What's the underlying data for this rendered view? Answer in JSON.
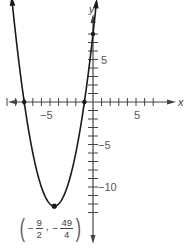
{
  "chart_data": {
    "type": "line",
    "title": "",
    "function": "f(x) = x^2 + 9x + 8",
    "xlabel": "x",
    "ylabel": "y",
    "xlim": [
      -10,
      7.5
    ],
    "ylim": [
      -14,
      9.5
    ],
    "x_ticks": [
      -10,
      -9,
      -8,
      -7,
      -6,
      -5,
      -4,
      -3,
      -2,
      -1,
      1,
      2,
      3,
      4,
      5,
      6,
      7
    ],
    "y_ticks": [
      -13,
      -12,
      -11,
      -10,
      -9,
      -8,
      -7,
      -6,
      -5,
      -4,
      -3,
      -2,
      -1,
      1,
      2,
      3,
      4,
      5,
      6,
      7,
      8
    ],
    "x_tick_labels": [
      "-5",
      "5"
    ],
    "y_tick_labels": [
      "5",
      "-5",
      "-10"
    ],
    "grid": false,
    "legend": null,
    "series": [
      {
        "name": "parabola",
        "x": [
          -9.4,
          -9,
          -8,
          -7,
          -6,
          -5,
          -4.5,
          -4,
          -3,
          -2,
          -1,
          0,
          0.4
        ],
        "y": [
          13.76,
          8,
          0,
          -6,
          -10,
          -12,
          -12.25,
          -12,
          -10,
          -6,
          0,
          8,
          11.76
        ]
      }
    ],
    "marked_points": [
      {
        "x": -8,
        "y": 0,
        "role": "x-intercept"
      },
      {
        "x": -1,
        "y": 0,
        "role": "x-intercept"
      },
      {
        "x": 0,
        "y": 8,
        "role": "y-intercept"
      },
      {
        "x": -4.5,
        "y": -12.25,
        "role": "vertex"
      }
    ],
    "annotations": [
      {
        "text": "(-9/2, -49/4)",
        "at": {
          "x": -4.5,
          "y": -12.25
        },
        "role": "vertex-label"
      }
    ]
  },
  "labels": {
    "x_axis": "x",
    "y_axis": "y",
    "x_tick_neg5": "−5",
    "x_tick_5": "5",
    "y_tick_5": "5",
    "y_tick_neg5": "−5",
    "y_tick_neg10": "−10",
    "vertex": {
      "open": "(",
      "close": ")",
      "minus": "−",
      "x_num": "9",
      "x_den": "2",
      "comma": ",",
      "y_num": "49",
      "y_den": "4"
    }
  },
  "style": {
    "axis_color": "#444444",
    "curve_color": "#1a1a1a",
    "tick_label_color": "#555555"
  }
}
